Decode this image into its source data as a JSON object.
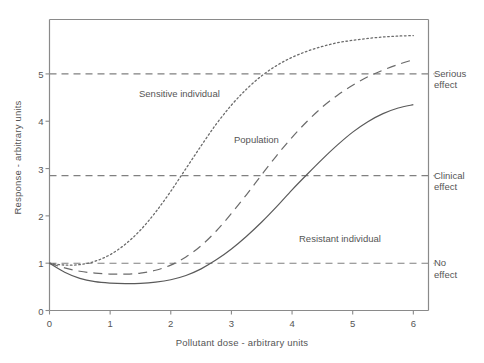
{
  "chart_data": {
    "type": "line",
    "title": "",
    "xlabel": "Pollutant dose - arbitrary units",
    "ylabel": "Response - arbitrary units",
    "xlim": [
      0,
      6.25
    ],
    "ylim": [
      0,
      6.15
    ],
    "xticks": [
      0,
      1,
      2,
      3,
      4,
      5,
      6
    ],
    "xtick_labels": [
      "0",
      "1",
      "2",
      "3",
      "4",
      "5",
      "6"
    ],
    "yticks": [
      0,
      1,
      2,
      3,
      4,
      5
    ],
    "ytick_labels": [
      "0",
      "1",
      "2",
      "3",
      "4",
      "5"
    ],
    "grid": false,
    "legend": "inline-annotations",
    "reference_lines": [
      {
        "name": "serious-effect",
        "value": 5.0,
        "label": "Serious\neffect",
        "label_line1": "Serious",
        "label_line2": "effect",
        "style": "dashed",
        "color": "#808080"
      },
      {
        "name": "clinical-effect",
        "value": 2.85,
        "label": "Clinical\neffect",
        "label_line1": "Clinical",
        "label_line2": "effect",
        "style": "dashed",
        "color": "#808080"
      },
      {
        "name": "no-effect",
        "value": 1.0,
        "label": "No\neffect",
        "label_line1": "No",
        "label_line2": "effect",
        "style": "dashed",
        "color": "#808080"
      }
    ],
    "series": [
      {
        "name": "Sensitive individual",
        "label": "Sensitive individual",
        "style": "dotted",
        "color": "#6b6b6b",
        "x": [
          0,
          0.25,
          0.5,
          0.75,
          1.0,
          1.25,
          1.5,
          1.75,
          2.0,
          2.25,
          2.5,
          2.75,
          3.0,
          3.25,
          3.5,
          3.75,
          4.0,
          4.25,
          4.5,
          4.75,
          5.0,
          5.25,
          5.5,
          5.75,
          6.0
        ],
        "y": [
          1.0,
          0.96,
          0.97,
          1.04,
          1.18,
          1.4,
          1.7,
          2.08,
          2.52,
          3.0,
          3.48,
          3.94,
          4.34,
          4.68,
          4.96,
          5.18,
          5.35,
          5.48,
          5.58,
          5.66,
          5.71,
          5.75,
          5.78,
          5.8,
          5.81
        ]
      },
      {
        "name": "Population",
        "label": "Population",
        "style": "dashed",
        "color": "#6b6b6b",
        "x": [
          0,
          0.25,
          0.5,
          0.75,
          1.0,
          1.25,
          1.5,
          1.75,
          2.0,
          2.25,
          2.5,
          2.75,
          3.0,
          3.25,
          3.5,
          3.75,
          4.0,
          4.25,
          4.5,
          4.75,
          5.0,
          5.25,
          5.5,
          5.75,
          6.0
        ],
        "y": [
          1.0,
          0.9,
          0.83,
          0.79,
          0.77,
          0.77,
          0.79,
          0.85,
          0.96,
          1.13,
          1.37,
          1.68,
          2.05,
          2.45,
          2.87,
          3.28,
          3.66,
          4.0,
          4.3,
          4.55,
          4.76,
          4.94,
          5.08,
          5.2,
          5.3
        ]
      },
      {
        "name": "Resistant individual",
        "label": "Resistant individual",
        "style": "solid",
        "color": "#5a5a5a",
        "x": [
          0,
          0.25,
          0.5,
          0.75,
          1.0,
          1.25,
          1.5,
          1.75,
          2.0,
          2.25,
          2.5,
          2.75,
          3.0,
          3.25,
          3.5,
          3.75,
          4.0,
          4.25,
          4.5,
          4.75,
          5.0,
          5.25,
          5.5,
          5.75,
          6.0
        ],
        "y": [
          1.0,
          0.81,
          0.68,
          0.61,
          0.58,
          0.57,
          0.575,
          0.6,
          0.65,
          0.74,
          0.88,
          1.07,
          1.3,
          1.57,
          1.87,
          2.2,
          2.55,
          2.88,
          3.2,
          3.5,
          3.77,
          3.99,
          4.16,
          4.28,
          4.35
        ]
      }
    ],
    "annotations": [
      {
        "name": "sensitive-individual-label",
        "text": "Sensitive individual",
        "x_px": 139,
        "y_px": 88
      },
      {
        "name": "population-label",
        "text": "Population",
        "x_px": 234,
        "y_px": 134
      },
      {
        "name": "resistant-individual-label",
        "text": "Resistant individual",
        "x_px": 299,
        "y_px": 233
      }
    ]
  },
  "axes": {
    "frame_color": "#8a8a8a"
  }
}
